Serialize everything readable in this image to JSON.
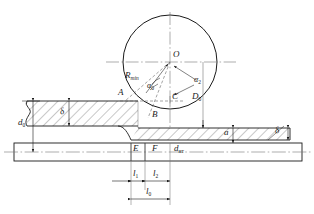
{
  "diagram": {
    "type": "engineering-cross-section",
    "colors": {
      "line": "#1a1a1a",
      "hatch": "#555555",
      "center_line": "#777777",
      "dashed": "#666666",
      "background": "#ffffff"
    },
    "labels": {
      "center_O": "O",
      "point_A": "A",
      "point_B": "B",
      "point_C": "C",
      "point_D0_base": "D",
      "point_D0_sub": "0",
      "point_E": "E",
      "point_F": "F",
      "radius_base": "R",
      "radius_sub": "min",
      "angle_0_base": "α",
      "angle_0_sub": "0",
      "angle_2_base": "α",
      "angle_2_sub": "2",
      "dia_d0_base": "d",
      "dia_d0_sub": "0",
      "dia_dm_base": "d",
      "dia_dm_sub": "нт",
      "thick_delta_left": "δ",
      "thick_delta_right": "δ",
      "height_a": "a",
      "len_l1_base": "l",
      "len_l1_sub": "1",
      "len_l2_base": "l",
      "len_l2_sub": "2",
      "len_l0_base": "l",
      "len_l0_sub": "0"
    },
    "elements": {
      "roller": "roller-circle",
      "upper_workpiece": "hatched-upper-section",
      "lower_workpiece": "hatched-lower-section",
      "mandrel": "base-plate",
      "break_line": "left-break-line"
    }
  }
}
